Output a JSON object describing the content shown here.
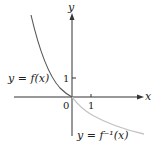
{
  "diagram": {
    "axes": {
      "x_label": "x",
      "y_label": "y",
      "origin_label": "0",
      "x_tick_label": "1",
      "y_tick_label": "1"
    },
    "curves": [
      {
        "name": "f",
        "label": "y = f(x)",
        "color": "#555555",
        "description": "decreasing curve through origin, left of y-axis"
      },
      {
        "name": "f_inverse",
        "label": "y = f⁻¹(x)",
        "color": "#c4c4c4",
        "description": "decreasing curve from origin to the right, below x-axis"
      }
    ],
    "colors": {
      "axis": "#333333",
      "background": "#ffffff"
    }
  }
}
